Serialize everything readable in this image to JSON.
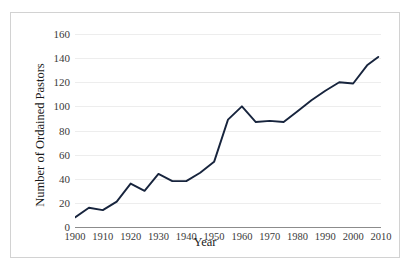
{
  "chart_data": {
    "type": "line",
    "title": "",
    "xlabel": "Year",
    "ylabel": "Number of Ordained Pastors",
    "xlim": [
      1900,
      2010
    ],
    "ylim": [
      0,
      160
    ],
    "ytick_step": 20,
    "yticks": [
      0,
      20,
      40,
      60,
      80,
      100,
      120,
      140,
      160
    ],
    "xticks": [
      1900,
      1910,
      1920,
      1930,
      1940,
      1950,
      1960,
      1970,
      1980,
      1990,
      2000,
      2010
    ],
    "grid": "horizontal",
    "legend": "none",
    "line_color": "#17243d",
    "series": [
      {
        "name": "Number of Ordained Pastors",
        "x": [
          1900,
          1905,
          1910,
          1915,
          1920,
          1925,
          1930,
          1935,
          1940,
          1945,
          1950,
          1955,
          1960,
          1965,
          1970,
          1975,
          1980,
          1985,
          1990,
          1995,
          2000,
          2005,
          2009
        ],
        "values": [
          8,
          16,
          14,
          21,
          36,
          30,
          44,
          38,
          38,
          45,
          54,
          89,
          100,
          87,
          88,
          87,
          96,
          105,
          113,
          120,
          119,
          134,
          141
        ]
      }
    ]
  },
  "axis": {
    "y_title": "Number of Ordained Pastors",
    "x_title": "Year"
  }
}
